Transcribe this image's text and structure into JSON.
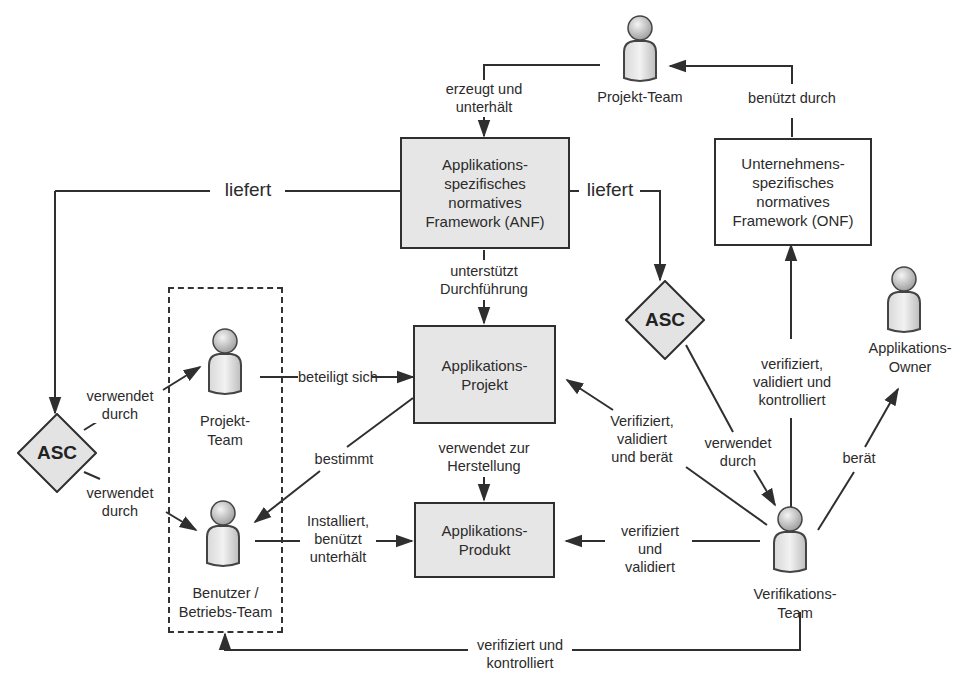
{
  "diagram": {
    "nodes": {
      "anf": "Applikations-\nspezifisches\nnormatives\nFramework (ANF)",
      "onf": "Unternehmens-\nspezifisches\nnormatives\nFramework (ONF)",
      "projekt": "Applikations-\nProjekt",
      "produkt": "Applikations-\nProdukt",
      "asc_left": "ASC",
      "asc_right": "ASC"
    },
    "actors": {
      "projekt_team_top": "Projekt-Team",
      "projekt_team_group": "Projekt-\nTeam",
      "benutzer": "Benutzer /\nBetriebs-Team",
      "app_owner": "Applikations-\nOwner",
      "verifikations_team": "Verifikations-\nTeam"
    },
    "edges": {
      "erzeugt": "erzeugt und\nunterhält",
      "benuetzt_durch": "benützt durch",
      "liefert_left": "liefert",
      "liefert_right": "liefert",
      "unterstuetzt": "unterstützt\nDurchführung",
      "verwendet_durch_1": "verwendet\ndurch",
      "verwendet_durch_2": "verwendet\ndurch",
      "verwendet_durch_3": "verwendet\ndurch",
      "beteiligt": "beteiligt sich",
      "bestimmt": "bestimmt",
      "verwendet_zur": "verwendet zur\nHerstellung",
      "installiert": "Installiert,\nbenützt\nunterhält",
      "verifiziert_beraet": "Verifiziert,\nvalidiert\nund berät",
      "verifiziert_validiert": "verifiziert und\nvalidiert",
      "verifiziert_kontrolliert_onf": "verifiziert,\nvalidiert und\nkontrolliert",
      "beraet": "berät",
      "verifiziert_kontrolliert_bottom": "verifiziert und\nkontrolliert"
    },
    "colors": {
      "box_fill": "#e6e6e6",
      "line": "#2f2f2f",
      "diamond_fill": "#e3e3e3"
    }
  }
}
